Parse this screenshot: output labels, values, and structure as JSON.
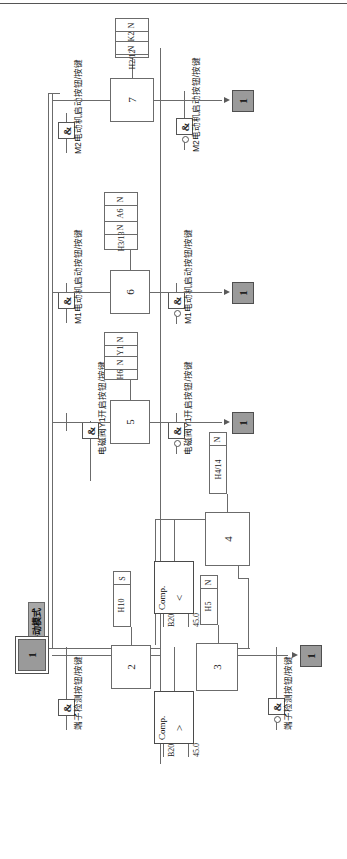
{
  "diagram": {
    "type": "sfc-grafcet",
    "orientation": "rotated-90ccw",
    "mode_label": "手动模式",
    "steps": [
      {
        "id": "s1",
        "label": "1",
        "kind": "initial"
      },
      {
        "id": "s2",
        "label": "2",
        "kind": "step"
      },
      {
        "id": "s3",
        "label": "3",
        "kind": "step"
      },
      {
        "id": "s4",
        "label": "4",
        "kind": "step"
      },
      {
        "id": "s5",
        "label": "5",
        "kind": "step"
      },
      {
        "id": "s6",
        "label": "6",
        "kind": "step"
      },
      {
        "id": "s7",
        "label": "7",
        "kind": "step"
      },
      {
        "id": "t1",
        "label": "1",
        "kind": "terminal"
      },
      {
        "id": "t2",
        "label": "1",
        "kind": "terminal"
      },
      {
        "id": "t3",
        "label": "1",
        "kind": "terminal"
      },
      {
        "id": "t4",
        "label": "1",
        "kind": "terminal"
      }
    ],
    "actions": [
      {
        "for": "2",
        "rows": [
          {
            "qualifier": "S",
            "name": "H10"
          }
        ]
      },
      {
        "for": "3",
        "rows": [
          {
            "qualifier": "N",
            "name": "H5"
          }
        ]
      },
      {
        "for": "4",
        "rows": [
          {
            "qualifier": "N",
            "name": "H4/14"
          }
        ]
      },
      {
        "for": "5",
        "rows": [
          {
            "qualifier": "N",
            "name": "Y1"
          },
          {
            "qualifier": "N",
            "name": "H6"
          }
        ]
      },
      {
        "for": "6",
        "rows": [
          {
            "qualifier": "N",
            "name": "A6"
          },
          {
            "qualifier": "N",
            "name": "H3/13"
          }
        ]
      },
      {
        "for": "7",
        "rows": [
          {
            "qualifier": "N",
            "name": "K2"
          },
          {
            "qualifier": "N",
            "name": "H2/12"
          }
        ]
      }
    ],
    "comparators": [
      {
        "id": "cmp1",
        "block": "Comp.",
        "operator": ">",
        "in1": "B20",
        "in2": "45.0"
      },
      {
        "id": "cmp2",
        "block": "Comp.",
        "operator": "<",
        "in1": "B20",
        "in2": "45.0"
      }
    ],
    "gates": [
      {
        "id": "g1",
        "symbol": "&",
        "negated": false,
        "label": "端子检测按钮/按键"
      },
      {
        "id": "g2",
        "symbol": "&",
        "negated": false,
        "label": "电磁阀Y1开启按钮/按键"
      },
      {
        "id": "g3",
        "symbol": "&",
        "negated": false,
        "label": "M1电动机启动按钮/按键"
      },
      {
        "id": "g4",
        "symbol": "&",
        "negated": false,
        "label": "M2电动机启动按钮/按键"
      },
      {
        "id": "g5",
        "symbol": "&",
        "negated": true,
        "label": "电磁阀Y1开启按钮/按键"
      },
      {
        "id": "g6",
        "symbol": "&",
        "negated": true,
        "label": "M1电动机启动按钮/按键"
      },
      {
        "id": "g7",
        "symbol": "&",
        "negated": true,
        "label": "M2电动机启动按钮/按键"
      },
      {
        "id": "g8",
        "symbol": "&",
        "negated": true,
        "label": "端子检测按钮/按键"
      }
    ],
    "colors": {
      "line": "#6b6b6b",
      "step_fill": "#ffffff",
      "initial_fill": "#9a9a9a",
      "terminal_fill": "#9a9a9a",
      "mode_fill": "#a8a8a8",
      "text": "#1a1a1a"
    }
  }
}
